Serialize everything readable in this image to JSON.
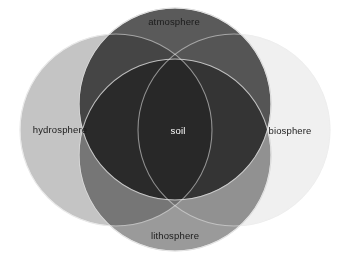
{
  "diagram": {
    "type": "venn",
    "title_visible": false,
    "background_color": "#ffffff",
    "blend_mode": "multiply",
    "canvas": {
      "width": 345,
      "height": 259
    },
    "sets": [
      {
        "id": "atmosphere",
        "label": "atmosphere",
        "position": "top",
        "fill": "#5a5a5a",
        "stroke": "#d8d8d8",
        "cx": 175,
        "cy": 104,
        "r": 96,
        "label_color": "#1b1b1b"
      },
      {
        "id": "hydrosphere",
        "label": "hydrosphere",
        "position": "left",
        "fill": "#c4c4c4",
        "stroke": "#e8e8e8",
        "cx": 116,
        "cy": 130,
        "r": 96,
        "label_color": "#1b1b1b"
      },
      {
        "id": "biosphere",
        "label": "biosphere",
        "position": "right",
        "fill": "#f0f0f0",
        "stroke": "#f6f6f6",
        "cx": 234,
        "cy": 130,
        "r": 96,
        "label_color": "#1b1b1b"
      },
      {
        "id": "lithosphere",
        "label": "lithosphere",
        "position": "bottom",
        "fill": "#9a9a9a",
        "stroke": "#dcdcdc",
        "cx": 175,
        "cy": 155,
        "r": 96,
        "label_color": "#1b1b1b"
      }
    ],
    "intersection": {
      "id": "soil",
      "label": "soil",
      "label_color": "#ffffff",
      "fill": "#090909"
    }
  }
}
